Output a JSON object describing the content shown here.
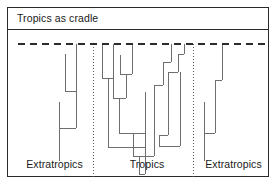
{
  "figure": {
    "title": "Tropics as cradle",
    "frame": {
      "border_color": "#2b2b2b",
      "background": "#ffffff"
    }
  },
  "regions": [
    {
      "id": "left-extratropics",
      "label": "Extratropics"
    },
    {
      "id": "tropics",
      "label": "Tropics"
    },
    {
      "id": "right-extratropics",
      "label": "Extratropics"
    }
  ],
  "chart_data": {
    "type": "diagram",
    "title": "Tropics as cradle",
    "subtype": "phylogenetic-tree-across-latitudinal-zones",
    "xlabel": "",
    "ylabel": "",
    "legend": [],
    "grid": false,
    "canvas": {
      "width": 262,
      "height": 148
    },
    "line_color": "#6e6e6e",
    "line_width": 1,
    "present_day_line": {
      "name": "present-day",
      "style": "dashed",
      "color": "#2b2b2b",
      "y": 14,
      "x_start": 10,
      "x_end": 258,
      "dash": "7 5"
    },
    "region_dividers": [
      {
        "name": "left-divider",
        "x": 85,
        "y_start": 14,
        "y_end": 148,
        "style": "dotted",
        "color": "#5a5a5a"
      },
      {
        "name": "right-divider",
        "x": 185,
        "y_start": 14,
        "y_end": 148,
        "style": "dotted",
        "color": "#5a5a5a"
      }
    ],
    "region_bounds": [
      {
        "name": "left-extratropics",
        "x_start": 10,
        "x_end": 85
      },
      {
        "name": "tropics",
        "x_start": 85,
        "x_end": 185
      },
      {
        "name": "right-extratropics",
        "x_start": 185,
        "x_end": 258
      }
    ],
    "branches": {
      "left_extratropics": {
        "verticals": [
          {
            "name": "lineage-a",
            "x": 68,
            "y_top": 14,
            "y_bottom": 98
          },
          {
            "name": "lineage-b",
            "x": 57,
            "y_top": 24,
            "y_bottom": 61
          },
          {
            "name": "lineage-c",
            "x": 51,
            "y_top": 72,
            "y_bottom": 131
          }
        ],
        "horizontals": [
          {
            "name": "node-1",
            "y": 61,
            "x_start": 57,
            "x_end": 68
          },
          {
            "name": "node-2",
            "y": 98,
            "x_start": 51,
            "x_end": 68
          }
        ]
      },
      "tropics": {
        "verticals": [
          {
            "name": "t-1",
            "x": 94,
            "y_top": 14,
            "y_bottom": 48
          },
          {
            "name": "t-2",
            "x": 105,
            "y_top": 14,
            "y_bottom": 68
          },
          {
            "name": "t-3",
            "x": 100,
            "y_top": 48,
            "y_bottom": 117
          },
          {
            "name": "t-4",
            "x": 112,
            "y_top": 25,
            "y_bottom": 44
          },
          {
            "name": "t-5",
            "x": 124,
            "y_top": 14,
            "y_bottom": 44
          },
          {
            "name": "t-6",
            "x": 118,
            "y_top": 44,
            "y_bottom": 68
          },
          {
            "name": "t-7",
            "x": 111,
            "y_top": 68,
            "y_bottom": 103
          },
          {
            "name": "t-8",
            "x": 125,
            "y_top": 103,
            "y_bottom": 126
          },
          {
            "name": "t-9",
            "x": 137,
            "y_top": 62,
            "y_bottom": 144
          },
          {
            "name": "t-10",
            "x": 146,
            "y_top": 55,
            "y_bottom": 126
          },
          {
            "name": "t-11",
            "x": 155,
            "y_top": 32,
            "y_bottom": 55
          },
          {
            "name": "t-12",
            "x": 160,
            "y_top": 42,
            "y_bottom": 105
          },
          {
            "name": "t-13",
            "x": 151,
            "y_top": 105,
            "y_bottom": 116
          },
          {
            "name": "t-14",
            "x": 163,
            "y_top": 14,
            "y_bottom": 32
          },
          {
            "name": "t-15",
            "x": 170,
            "y_top": 24,
            "y_bottom": 42
          },
          {
            "name": "t-16",
            "x": 176,
            "y_top": 14,
            "y_bottom": 24
          },
          {
            "name": "t-17",
            "x": 172,
            "y_top": 42,
            "y_bottom": 116
          },
          {
            "name": "t-18",
            "x": 131,
            "y_top": 126,
            "y_bottom": 144
          }
        ],
        "horizontals": [
          {
            "name": "n-1",
            "y": 48,
            "x_start": 94,
            "x_end": 105
          },
          {
            "name": "n-2",
            "y": 44,
            "x_start": 112,
            "x_end": 124
          },
          {
            "name": "n-3",
            "y": 68,
            "x_start": 105,
            "x_end": 118
          },
          {
            "name": "n-4",
            "y": 103,
            "x_start": 111,
            "x_end": 137
          },
          {
            "name": "n-5",
            "y": 117,
            "x_start": 100,
            "x_end": 137
          },
          {
            "name": "n-6",
            "y": 126,
            "x_start": 125,
            "x_end": 146
          },
          {
            "name": "n-7",
            "y": 55,
            "x_start": 146,
            "x_end": 155
          },
          {
            "name": "n-8",
            "y": 32,
            "x_start": 155,
            "x_end": 163
          },
          {
            "name": "n-9",
            "y": 24,
            "x_start": 170,
            "x_end": 176
          },
          {
            "name": "n-10",
            "y": 42,
            "x_start": 160,
            "x_end": 170
          },
          {
            "name": "n-11",
            "y": 105,
            "x_start": 151,
            "x_end": 160
          },
          {
            "name": "n-12",
            "y": 116,
            "x_start": 151,
            "x_end": 172
          },
          {
            "name": "n-13",
            "y": 144,
            "x_start": 131,
            "x_end": 137
          }
        ]
      },
      "right_extratropics": {
        "verticals": [
          {
            "name": "r-a",
            "x": 214,
            "y_top": 14,
            "y_bottom": 50
          },
          {
            "name": "r-b",
            "x": 207,
            "y_top": 50,
            "y_bottom": 103
          },
          {
            "name": "r-c",
            "x": 196,
            "y_top": 72,
            "y_bottom": 131
          }
        ],
        "horizontals": [
          {
            "name": "r-n1",
            "y": 50,
            "x_start": 207,
            "x_end": 214
          },
          {
            "name": "r-n2",
            "y": 103,
            "x_start": 196,
            "x_end": 207
          }
        ]
      }
    }
  }
}
